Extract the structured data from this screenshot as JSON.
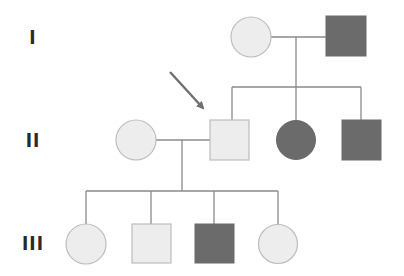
{
  "diagram": {
    "type": "pedigree",
    "colors": {
      "unaffected_fill": "#ededed",
      "unaffected_stroke": "#bdbdbd",
      "affected_fill": "#6b6b6b",
      "affected_stroke": "#6b6b6b",
      "line": "#8a8a8a",
      "arrow": "#6f6f6f"
    },
    "generations": [
      {
        "label": "I",
        "y": 37
      },
      {
        "label": "II",
        "y": 140
      },
      {
        "label": "III",
        "y": 243
      }
    ],
    "individuals": [
      {
        "id": "I-1",
        "generation": "I",
        "sex": "female",
        "affected": false,
        "cx": 251,
        "cy": 37
      },
      {
        "id": "I-2",
        "generation": "I",
        "sex": "male",
        "affected": true,
        "cx": 346,
        "cy": 36
      },
      {
        "id": "II-1",
        "generation": "II",
        "sex": "female",
        "affected": false,
        "cx": 136,
        "cy": 140
      },
      {
        "id": "II-2",
        "generation": "II",
        "sex": "male",
        "affected": false,
        "cx": 230,
        "cy": 140,
        "proband": true
      },
      {
        "id": "II-3",
        "generation": "II",
        "sex": "female",
        "affected": true,
        "cx": 296,
        "cy": 140
      },
      {
        "id": "II-4",
        "generation": "II",
        "sex": "male",
        "affected": true,
        "cx": 362,
        "cy": 140
      },
      {
        "id": "III-1",
        "generation": "III",
        "sex": "female",
        "affected": false,
        "cx": 86,
        "cy": 244
      },
      {
        "id": "III-2",
        "generation": "III",
        "sex": "male",
        "affected": false,
        "cx": 151,
        "cy": 244
      },
      {
        "id": "III-3",
        "generation": "III",
        "sex": "male",
        "affected": true,
        "cx": 214,
        "cy": 244
      },
      {
        "id": "III-4",
        "generation": "III",
        "sex": "female",
        "affected": false,
        "cx": 278,
        "cy": 244
      }
    ],
    "proband_marker": "arrow pointing to II-2"
  }
}
